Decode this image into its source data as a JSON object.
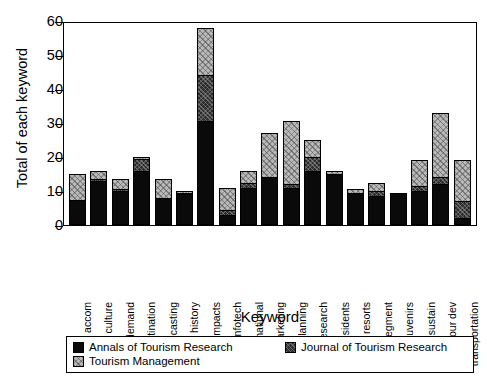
{
  "chart_data": {
    "type": "bar",
    "subtype": "stacked",
    "title": "",
    "xlabel": "Keyword",
    "ylabel": "Total of each keyword",
    "ylim": [
      0,
      60
    ],
    "yticks": [
      0,
      10,
      20,
      30,
      40,
      50,
      60
    ],
    "grid": false,
    "legend_position": "bottom",
    "categories": [
      "accom",
      "culture",
      "demand",
      "destination",
      "forecasting",
      "history",
      "impacts",
      "infotech",
      "international",
      "marketing",
      "planning",
      "research",
      "residents",
      "resorts",
      "segment",
      "souvenirs",
      "sustain",
      "tour dev",
      "transportation"
    ],
    "series": [
      {
        "name": "Annals of Tourism Research",
        "color": "#0a0a0a",
        "values": [
          7.5,
          13,
          10,
          16,
          8,
          9,
          30.5,
          3,
          11,
          14,
          11,
          16,
          15,
          9.5,
          8.5,
          9.5,
          10,
          12,
          2
        ]
      },
      {
        "name": "Journal of Tourism Research",
        "color": "#2a2a2a",
        "values": [
          0,
          0.5,
          0.5,
          3.5,
          0,
          0.5,
          13.5,
          1.5,
          1.5,
          0,
          1,
          4,
          0,
          0,
          1.5,
          0,
          1.5,
          2,
          5
        ]
      },
      {
        "name": "Tourism Management",
        "color": "#b9b9b9",
        "values": [
          7.5,
          2.5,
          3,
          0.5,
          5.5,
          0.5,
          14,
          6.5,
          3.5,
          13,
          18.5,
          5,
          1,
          1,
          2.5,
          0,
          7.5,
          19,
          12
        ]
      }
    ],
    "totals": [
      15,
      16,
      13.5,
      20,
      13.5,
      10,
      58,
      11,
      16,
      27,
      30.5,
      25,
      16,
      10.5,
      12.5,
      9.5,
      19,
      33,
      19
    ]
  },
  "legend": {
    "items": [
      {
        "label": "Annals of Tourism Research",
        "swatch": "annals"
      },
      {
        "label": "Journal of Tourism Research",
        "swatch": "journal"
      },
      {
        "label": "Tourism Management",
        "swatch": "tourism"
      }
    ]
  }
}
